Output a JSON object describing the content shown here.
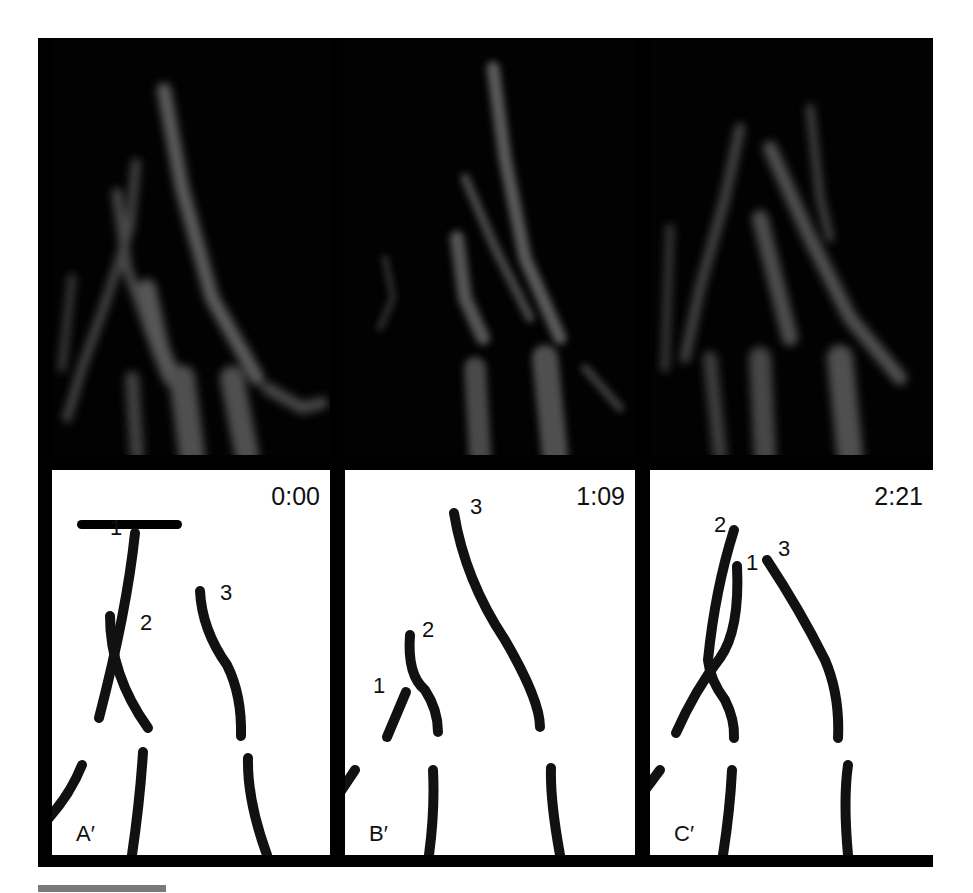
{
  "figure": {
    "panels_top": [
      {
        "id": "A",
        "description": "fluorescence micrograph of filopodia/actin bundles, frame 1"
      },
      {
        "id": "B",
        "description": "fluorescence micrograph, frame 2"
      },
      {
        "id": "C",
        "description": "fluorescence micrograph, frame 3"
      }
    ],
    "panels_bottom": [
      {
        "label": "A′",
        "time": "0:00",
        "tracks": [
          "1",
          "2",
          "3"
        ]
      },
      {
        "label": "B′",
        "time": "1:09",
        "tracks": [
          "1",
          "2",
          "3"
        ]
      },
      {
        "label": "C′",
        "time": "2:21",
        "tracks": [
          "2",
          "1",
          "3"
        ]
      }
    ],
    "scale_bar": "scale bar",
    "colors": {
      "frame": "#000000",
      "micrograph_signal": "#5a5a5a",
      "tracing": "#111111",
      "footer_bar": "#7a7a7a"
    }
  }
}
